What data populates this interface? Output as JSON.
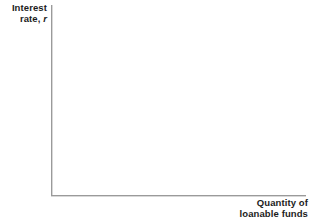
{
  "figure": {
    "background_color": "#ffffff",
    "axis_color": "#9a9a9a",
    "text_color": "#1c1c1c"
  },
  "y_axis": {
    "label_line1": "Interest",
    "label_line2_prefix": "rate, ",
    "label_variable": "r"
  },
  "x_axis": {
    "label_line1": "Quantity of",
    "label_line2": "loanable funds"
  },
  "chart_data": {
    "type": "line",
    "title": "",
    "subtitle": "",
    "xlabel": "Quantity of loanable funds",
    "ylabel": "Interest rate, r",
    "series": [],
    "categories": [],
    "x": [],
    "values": [],
    "annotations": [],
    "legend": [],
    "legend_position": "none",
    "grid": false,
    "xticks": [],
    "yticks": [],
    "xtick_labels": [],
    "ytick_labels": [],
    "xlim": [
      0,
      1
    ],
    "ylim": [
      0,
      1
    ],
    "note": "Blank axes template: no curves, data points, tick marks, or gridlines are drawn."
  }
}
